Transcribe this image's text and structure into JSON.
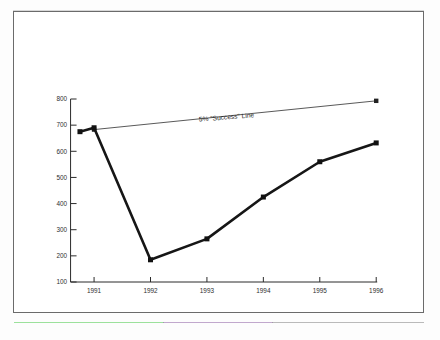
{
  "figure": {
    "background_color": "#ffffff",
    "frame_color": "#6b6b6b"
  },
  "chart_data": {
    "type": "line",
    "title": "",
    "subtitle": "",
    "xlabel": "",
    "ylabel": "",
    "grid": false,
    "legend_position": "none",
    "xlim": [
      1990.6,
      1996.2
    ],
    "ylim": [
      100,
      800
    ],
    "x_tick_labels": [
      "1991",
      "1992",
      "1993",
      "1994",
      "1995",
      "1996"
    ],
    "x_ticks": [
      1991,
      1992,
      1993,
      1994,
      1995,
      1996
    ],
    "y_tick_labels": [
      "100",
      "200",
      "300",
      "400",
      "500",
      "600",
      "700",
      "800"
    ],
    "y_ticks": [
      100,
      200,
      300,
      400,
      500,
      600,
      700,
      800
    ],
    "series": [
      {
        "name": "main-series",
        "style": "thick",
        "marker": "square",
        "x": [
          1990.75,
          1991,
          1992,
          1993,
          1994,
          1995,
          1996
        ],
        "values": [
          675,
          690,
          185,
          265,
          425,
          560,
          632
        ]
      },
      {
        "name": "success-line",
        "style": "thin",
        "marker": "square",
        "x": [
          1991,
          1996
        ],
        "values": [
          683,
          793
        ]
      }
    ],
    "annotations": [
      {
        "text": "5% \"Success\" Line",
        "x": 1993.35,
        "y": 722,
        "rotation": -4.5
      }
    ]
  }
}
